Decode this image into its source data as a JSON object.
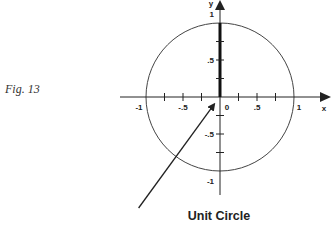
{
  "figure_label": "Fig. 13",
  "title": "Unit Circle",
  "axes": {
    "x_label": "x",
    "y_label": "y",
    "x_ticks": [
      {
        "value": -1,
        "label": "-1"
      },
      {
        "value": -0.75,
        "label": ""
      },
      {
        "value": -0.5,
        "label": "-.5"
      },
      {
        "value": -0.25,
        "label": ""
      },
      {
        "value": 0,
        "label": "0"
      },
      {
        "value": 0.25,
        "label": ""
      },
      {
        "value": 0.5,
        "label": ".5"
      },
      {
        "value": 0.75,
        "label": ""
      },
      {
        "value": 1,
        "label": "1"
      }
    ],
    "y_ticks": [
      {
        "value": 1,
        "label": "1"
      },
      {
        "value": 0.75,
        "label": ""
      },
      {
        "value": 0.5,
        "label": ".5"
      },
      {
        "value": 0.25,
        "label": ""
      },
      {
        "value": -0.25,
        "label": ""
      },
      {
        "value": -0.5,
        "label": "-.5"
      },
      {
        "value": -0.75,
        "label": ""
      },
      {
        "value": -1,
        "label": "-1"
      }
    ]
  },
  "circle": {
    "radius": 1,
    "center": [
      0,
      0
    ]
  },
  "highlighted_segment": {
    "from": [
      0,
      0
    ],
    "to": [
      0,
      1
    ]
  },
  "pointer_arrow": {
    "from": [
      -1.1,
      -1.5
    ],
    "to": [
      -0.08,
      -0.1
    ]
  }
}
